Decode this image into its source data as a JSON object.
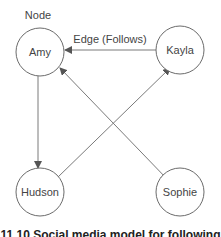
{
  "diagram": {
    "annotations": {
      "node_label": "Node",
      "edge_label": "Edge (Follows)"
    },
    "nodes": [
      {
        "id": "amy",
        "label": "Amy",
        "cx": 40,
        "cy": 52
      },
      {
        "id": "kayla",
        "label": "Kayla",
        "cx": 180,
        "cy": 50
      },
      {
        "id": "hudson",
        "label": "Hudson",
        "cx": 40,
        "cy": 192
      },
      {
        "id": "sophie",
        "label": "Sophie",
        "cx": 180,
        "cy": 192
      }
    ],
    "edges": [
      {
        "from": "Kayla",
        "to": "Amy"
      },
      {
        "from": "Amy",
        "to": "Hudson"
      },
      {
        "from": "Hudson",
        "to": "Kayla"
      },
      {
        "from": "Amy",
        "to": "Sophie"
      },
      {
        "from": "Sophie",
        "to": "Amy"
      }
    ],
    "colors": {
      "stroke": "#6b6b6b",
      "edge": "#7a7a7a",
      "text": "#444444"
    },
    "caption": "11.10 Social media model for following"
  }
}
